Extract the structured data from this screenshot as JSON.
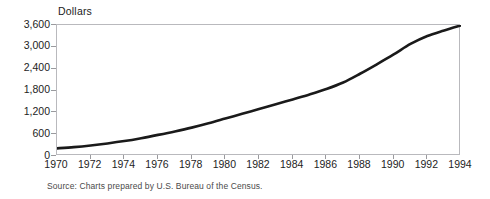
{
  "chart_data": {
    "type": "line",
    "title": "",
    "subtitle": "",
    "xlabel": "",
    "ylabel": "Dollars",
    "ylim": [
      0,
      3600
    ],
    "xlim": [
      1970,
      1994
    ],
    "grid": false,
    "legend": null,
    "legend_position": "none",
    "line_color": "#1a1a1a",
    "axis_color": "#b9b9bd",
    "y_ticks": [
      0,
      600,
      1200,
      1800,
      2400,
      3000,
      3600
    ],
    "y_tick_labels": [
      "0",
      "600",
      "1,200",
      "1,800",
      "2,400",
      "3,000",
      "3,600"
    ],
    "x_ticks": [
      1970,
      1972,
      1974,
      1976,
      1978,
      1980,
      1982,
      1984,
      1986,
      1988,
      1990,
      1992,
      1994
    ],
    "x_tick_labels": [
      "1970",
      "1972",
      "1974",
      "1976",
      "1978",
      "1980",
      "1982",
      "1984",
      "1986",
      "1988",
      "1990",
      "1992",
      "1994"
    ],
    "x": [
      1970,
      1971,
      1972,
      1973,
      1974,
      1975,
      1976,
      1977,
      1978,
      1979,
      1980,
      1981,
      1982,
      1983,
      1984,
      1985,
      1986,
      1987,
      1988,
      1989,
      1990,
      1991,
      1992,
      1993,
      1994
    ],
    "values": [
      210,
      245,
      290,
      345,
      410,
      490,
      580,
      675,
      780,
      900,
      1030,
      1160,
      1290,
      1420,
      1555,
      1690,
      1840,
      2020,
      2260,
      2520,
      2790,
      3080,
      3300,
      3450,
      3590
    ],
    "series": [
      {
        "name": "Dollars",
        "values": [
          210,
          245,
          290,
          345,
          410,
          490,
          580,
          675,
          780,
          900,
          1030,
          1160,
          1290,
          1420,
          1555,
          1690,
          1840,
          2020,
          2260,
          2520,
          2790,
          3080,
          3300,
          3450,
          3590
        ]
      }
    ],
    "annotations": []
  },
  "axis": {
    "y_title": "Dollars"
  },
  "footer": {
    "source": "Source:  Charts prepared by U.S. Bureau of the Census."
  }
}
